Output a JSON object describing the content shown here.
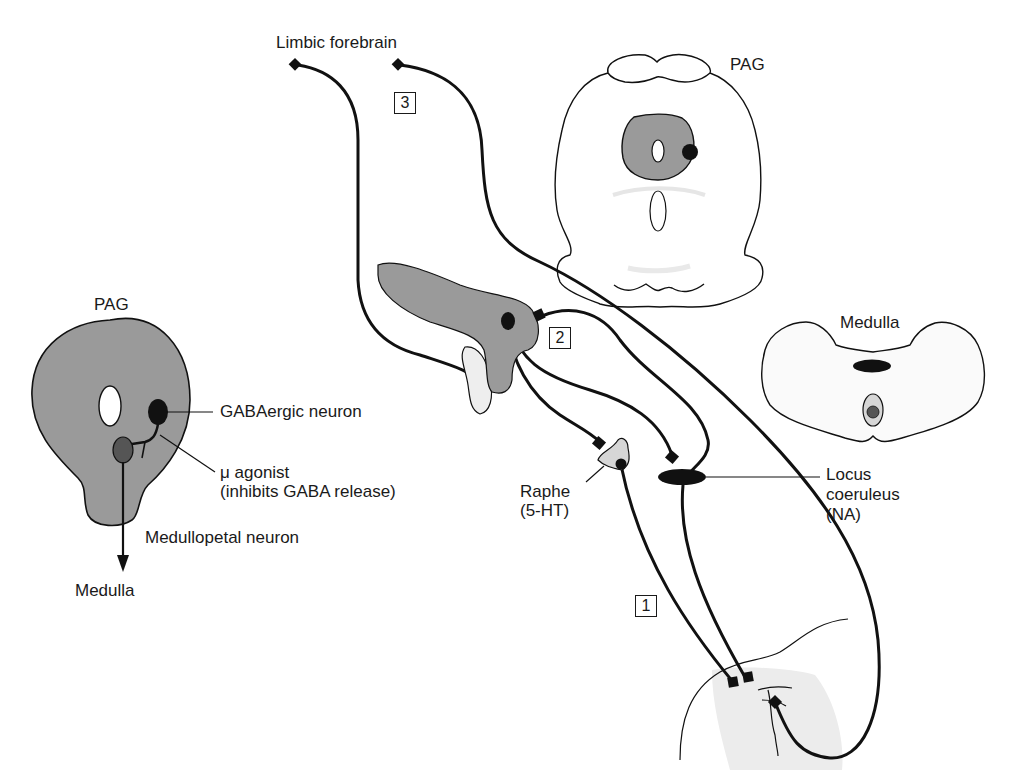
{
  "figure": {
    "colors": {
      "stroke": "#111111",
      "gray_region": "#9a9a9a",
      "light_region": "#e6e6e6",
      "neuron_dark": "#111111",
      "neuron_mid": "#555555"
    },
    "left_panel": {
      "title": "PAG",
      "labels": {
        "gaba_neuron": "GABAergic neuron",
        "mu_agonist_line1": "μ agonist",
        "mu_agonist_line2": "(inhibits GABA release)",
        "medullopetal": "Medullopetal neuron",
        "medulla": "Medulla"
      }
    },
    "top_label": "Limbic forebrain",
    "pathway_boxes": [
      "1",
      "2",
      "3"
    ],
    "pag_section": {
      "title": "PAG"
    },
    "medulla_section": {
      "title": "Medulla"
    },
    "nuclei": {
      "raphe_line1": "Raphe",
      "raphe_line2": "(5-HT)",
      "lc_line1": "Locus",
      "lc_line2": "coeruleus",
      "lc_line3": "(NA)"
    }
  }
}
